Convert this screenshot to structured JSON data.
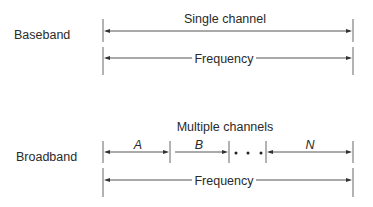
{
  "diagram": {
    "baseband": {
      "row_label": "Baseband",
      "channel_label": "Single channel",
      "frequency_label": "Frequency"
    },
    "broadband": {
      "row_label": "Broadband",
      "channels_label": "Multiple channels",
      "channels": [
        {
          "label": "A"
        },
        {
          "label": "B"
        },
        {
          "label": "N"
        }
      ],
      "ellipsis": "• • •",
      "frequency_label": "Frequency"
    },
    "colors": {
      "line": "#555555",
      "text": "#2a2a2a",
      "background": "#ffffff"
    }
  }
}
